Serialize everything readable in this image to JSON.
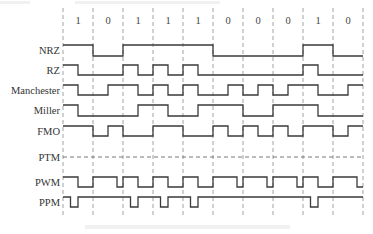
{
  "bits": [
    "1",
    "0",
    "1",
    "1",
    "1",
    "0",
    "0",
    "0",
    "1",
    "0"
  ],
  "signals": [
    {
      "name": "NRZ",
      "type": "levels",
      "levels": [
        [
          1,
          1
        ],
        [
          0,
          0
        ],
        [
          1,
          1
        ],
        [
          1,
          1
        ],
        [
          1,
          1
        ],
        [
          0,
          0
        ],
        [
          0,
          0
        ],
        [
          0,
          0
        ],
        [
          1,
          1
        ],
        [
          0,
          0
        ]
      ]
    },
    {
      "name": "RZ",
      "type": "levels",
      "levels": [
        [
          1,
          0
        ],
        [
          0,
          0
        ],
        [
          1,
          0
        ],
        [
          1,
          0
        ],
        [
          1,
          0
        ],
        [
          0,
          0
        ],
        [
          0,
          0
        ],
        [
          0,
          0
        ],
        [
          1,
          0
        ],
        [
          0,
          0
        ]
      ]
    },
    {
      "name": "Manchester",
      "type": "levels",
      "levels": [
        [
          1,
          0
        ],
        [
          0,
          1
        ],
        [
          1,
          0
        ],
        [
          1,
          0
        ],
        [
          1,
          0
        ],
        [
          0,
          1
        ],
        [
          0,
          1
        ],
        [
          0,
          1
        ],
        [
          1,
          0
        ],
        [
          0,
          1
        ]
      ]
    },
    {
      "name": "Miller",
      "type": "levels",
      "levels": [
        [
          1,
          0
        ],
        [
          0,
          0
        ],
        [
          0,
          1
        ],
        [
          1,
          0
        ],
        [
          0,
          1
        ],
        [
          1,
          1
        ],
        [
          0,
          0
        ],
        [
          1,
          1
        ],
        [
          1,
          0
        ],
        [
          0,
          0
        ]
      ]
    },
    {
      "name": "FMO",
      "type": "levels",
      "levels": [
        [
          1,
          1
        ],
        [
          0,
          1
        ],
        [
          0,
          0
        ],
        [
          1,
          1
        ],
        [
          0,
          0
        ],
        [
          1,
          0
        ],
        [
          1,
          0
        ],
        [
          1,
          0
        ],
        [
          1,
          1
        ],
        [
          0,
          1
        ]
      ]
    },
    {
      "name": "PTM",
      "type": "dashed"
    },
    {
      "name": "PWM",
      "type": "pwm",
      "high_fraction": {
        "1": 0.5,
        "0": 0.8
      }
    },
    {
      "name": "PPM",
      "type": "ppm",
      "pulse_window": {
        "1": [
          0.25,
          0.5
        ]
      }
    }
  ]
}
